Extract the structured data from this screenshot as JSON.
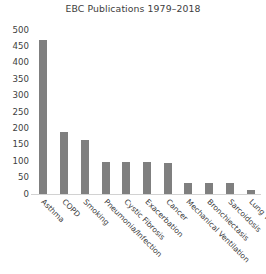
{
  "chart_data": {
    "type": "bar",
    "title": "EBC Publications 1979–2018",
    "xlabel": "",
    "ylabel": "",
    "ylim": [
      0,
      500
    ],
    "ytick_step": 50,
    "yticks": [
      500,
      450,
      400,
      350,
      300,
      250,
      200,
      150,
      100,
      50,
      0
    ],
    "grid": false,
    "legend": false,
    "bar_color": "#7f7f7f",
    "background_color": "#ffffff",
    "axis_line_color": "#d2d2d2",
    "text_color": "#404040",
    "xtick_rotation_deg": 45,
    "categories": [
      "Asthma",
      "COPD",
      "Smoking",
      "Pneumonia/Infection",
      "Cystic Fibrosis",
      "Exacerbation",
      "Cancer",
      "Mechanical Ventilation",
      "Bronchiectasis",
      "Sarcoidosis",
      "Lung Transplant"
    ],
    "values": [
      470,
      190,
      165,
      98,
      98,
      97,
      95,
      35,
      35,
      35,
      12
    ]
  }
}
